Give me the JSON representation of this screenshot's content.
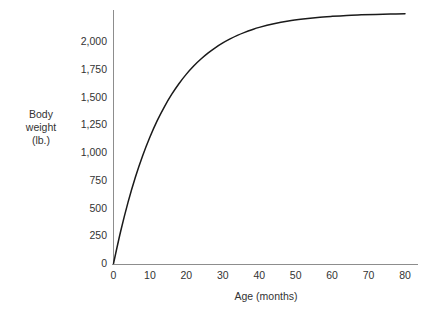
{
  "chart_data": {
    "type": "line",
    "title": "",
    "subtitle": "",
    "xlabel": "Age (months)",
    "ylabel": "Body weight (lb.)",
    "ylabel_lines": [
      "Body",
      "weight",
      "(lb.)"
    ],
    "xlim": [
      0,
      80
    ],
    "ylim": [
      0,
      2150
    ],
    "x_ticks": [
      0,
      10,
      20,
      30,
      40,
      50,
      60,
      70,
      80
    ],
    "x_tick_labels": [
      "0",
      "10",
      "20",
      "30",
      "40",
      "50",
      "60",
      "70",
      "80"
    ],
    "y_ticks": [
      0,
      250,
      500,
      750,
      1000,
      1250,
      1500,
      1750,
      2000
    ],
    "y_tick_labels": [
      "0",
      "250",
      "500",
      "750",
      "1,000",
      "1,250",
      "1,500",
      "1,750",
      "2,000"
    ],
    "grid": false,
    "legend": false,
    "legend_position": "none",
    "asymptote": 2150,
    "series": [
      {
        "name": "Body weight",
        "color": "#1a1a1a",
        "x": [
          0,
          2,
          4,
          6,
          8,
          10,
          12,
          14,
          16,
          18,
          20,
          22,
          24,
          26,
          28,
          30,
          32,
          34,
          36,
          38,
          40,
          44,
          48,
          52,
          56,
          60,
          64,
          68,
          72,
          76,
          80
        ],
        "values": [
          0,
          295,
          553,
          777,
          971,
          1140,
          1287,
          1414,
          1525,
          1622,
          1706,
          1779,
          1842,
          1897,
          1945,
          1987,
          2023,
          2055,
          2082,
          2106,
          2127,
          2160,
          2185,
          2203,
          2217,
          2227,
          2235,
          2240,
          2244,
          2247,
          2249
        ]
      }
    ],
    "colors": {
      "curve": "#1a1a1a",
      "axis": "#8d8d8d",
      "text": "#333333",
      "background": "#ffffff"
    }
  },
  "axes": {
    "x_title": "Age (months)",
    "y_title_lines": [
      "Body",
      "weight",
      "(lb.)"
    ]
  }
}
